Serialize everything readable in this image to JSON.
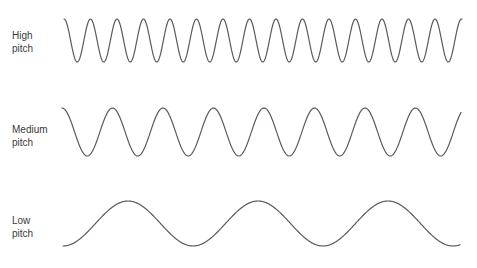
{
  "figure": {
    "rows": [
      {
        "id": "high",
        "label_line1": "High",
        "label_line2": "pitch",
        "wave": {
          "x_start": 64,
          "x_end": 462,
          "y_top": 19,
          "y_bottom": 62,
          "period": 26.5,
          "phase_start": "top-descending"
        }
      },
      {
        "id": "medium",
        "label_line1": "Medium",
        "label_line2": "pitch",
        "wave": {
          "x_start": 62,
          "x_end": 461,
          "y_top": 108,
          "y_bottom": 156,
          "period": 50.5,
          "phase_start": "top-descending"
        }
      },
      {
        "id": "low",
        "label_line1": "Low",
        "label_line2": "pitch",
        "wave": {
          "x_start": 63,
          "x_end": 460,
          "y_top": 201,
          "y_bottom": 246,
          "period": 130,
          "phase_start": "bottom-ascending"
        }
      }
    ],
    "stroke_color": "#5a5a5a",
    "label_color": "#3a3a3a",
    "background": "#ffffff"
  }
}
